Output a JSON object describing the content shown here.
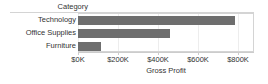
{
  "header": {
    "field_label": "Category"
  },
  "axis": {
    "x_title": "Gross Profit",
    "tick_labels": [
      "$0K",
      "$200K",
      "$400K",
      "$600K",
      "$800K"
    ]
  },
  "rows": [
    {
      "label": "Technology"
    },
    {
      "label": "Office Supplies"
    },
    {
      "label": "Furniture"
    }
  ],
  "colors": {
    "bar": "#6e6e6e",
    "gridline": "#ededed",
    "border": "#d4d4d4",
    "text": "#333333",
    "background": "#ffffff"
  },
  "chart_data": {
    "type": "bar",
    "orientation": "horizontal",
    "title": "",
    "subtitle": "",
    "xlabel": "Gross Profit",
    "ylabel": "Category",
    "categories": [
      "Technology",
      "Office Supplies",
      "Furniture"
    ],
    "values": [
      787000,
      460000,
      115000
    ],
    "value_labels": [
      "$787K",
      "$460K",
      "$115K"
    ],
    "xlim": [
      0,
      880000
    ],
    "xticks": [
      0,
      200000,
      400000,
      600000,
      800000
    ],
    "xticklabels": [
      "$0K",
      "$200K",
      "$400K",
      "$600K",
      "$800K"
    ],
    "grid": true,
    "grid_axis": "x",
    "legend": false,
    "legend_position": "none",
    "series": [
      {
        "name": "Gross Profit",
        "color": "#6e6e6e",
        "values": [
          787000,
          460000,
          115000
        ]
      }
    ]
  }
}
